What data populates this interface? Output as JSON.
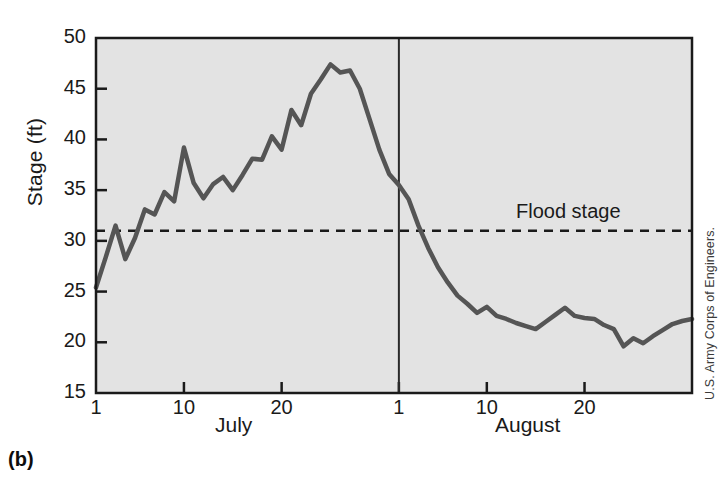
{
  "figure": {
    "panel_label": "(b)",
    "credit": "U.S. Army Corps of Engineers.",
    "flood_stage_label": "Flood stage",
    "plot_bg_color": "#e3e3e3",
    "line_color": "#555555",
    "frame_color": "#1a1a1a",
    "page_bg_color": "#ffffff"
  },
  "chart_data": {
    "type": "line",
    "title": "",
    "xlabel": "",
    "ylabel": "Stage (ft)",
    "ylim": [
      15,
      50
    ],
    "yticks": [
      15,
      20,
      25,
      30,
      35,
      40,
      45,
      50
    ],
    "ytick_labels": [
      "15",
      "20",
      "25",
      "30",
      "35",
      "40",
      "45",
      "50"
    ],
    "grid": false,
    "legend": "none",
    "x_axis_type": "date",
    "x_month_labels": [
      "July",
      "August"
    ],
    "xticks": [
      {
        "day_index": 0,
        "label": "1",
        "month": "July"
      },
      {
        "day_index": 9,
        "label": "10",
        "month": "July"
      },
      {
        "day_index": 19,
        "label": "20",
        "month": "July"
      },
      {
        "day_index": 31,
        "label": "1",
        "month": "August"
      },
      {
        "day_index": 40,
        "label": "10",
        "month": "August"
      },
      {
        "day_index": 50,
        "label": "20",
        "month": "August"
      }
    ],
    "annotations": [
      {
        "name": "flood-stage-line",
        "type": "hline",
        "y": 31.0,
        "style": "dashed",
        "label": "Flood stage"
      },
      {
        "name": "month-divider",
        "type": "vline",
        "x_day_index": 31,
        "style": "solid"
      }
    ],
    "series": [
      {
        "name": "River stage",
        "units": "ft",
        "x": [
          0,
          1,
          2,
          3,
          4,
          5,
          6,
          7,
          8,
          9,
          10,
          11,
          12,
          13,
          14,
          15,
          16,
          17,
          18,
          19,
          20,
          21,
          22,
          23,
          24,
          25,
          26,
          27,
          28,
          29,
          30,
          31,
          32,
          33,
          34,
          35,
          36,
          37,
          38,
          39,
          40,
          41,
          42,
          43,
          44,
          45,
          46,
          47,
          48,
          49,
          50,
          51,
          52,
          53,
          54,
          55,
          56,
          57,
          58,
          59,
          60,
          61
        ],
        "x_labels": [
          "Jul 1",
          "Jul 2",
          "Jul 3",
          "Jul 4",
          "Jul 5",
          "Jul 6",
          "Jul 7",
          "Jul 8",
          "Jul 9",
          "Jul 10",
          "Jul 11",
          "Jul 12",
          "Jul 13",
          "Jul 14",
          "Jul 15",
          "Jul 16",
          "Jul 17",
          "Jul 18",
          "Jul 19",
          "Jul 20",
          "Jul 21",
          "Jul 22",
          "Jul 23",
          "Jul 24",
          "Jul 25",
          "Jul 26",
          "Jul 27",
          "Jul 28",
          "Jul 29",
          "Jul 30",
          "Jul 31",
          "Aug 1",
          "Aug 2",
          "Aug 3",
          "Aug 4",
          "Aug 5",
          "Aug 6",
          "Aug 7",
          "Aug 8",
          "Aug 9",
          "Aug 10",
          "Aug 11",
          "Aug 12",
          "Aug 13",
          "Aug 14",
          "Aug 15",
          "Aug 16",
          "Aug 17",
          "Aug 18",
          "Aug 19",
          "Aug 20",
          "Aug 21",
          "Aug 22",
          "Aug 23",
          "Aug 24",
          "Aug 25",
          "Aug 26",
          "Aug 27",
          "Aug 28",
          "Aug 29",
          "Aug 30",
          "Aug 31"
        ],
        "values": [
          25.4,
          28.4,
          31.5,
          28.2,
          30.3,
          33.1,
          32.6,
          34.8,
          33.9,
          39.2,
          35.7,
          34.2,
          35.6,
          36.3,
          35.0,
          36.5,
          38.1,
          38.0,
          40.3,
          39.0,
          42.9,
          41.4,
          44.5,
          45.9,
          47.4,
          46.6,
          46.8,
          45.0,
          42.0,
          39.0,
          36.6,
          35.5,
          34.1,
          31.5,
          29.3,
          27.4,
          25.9,
          24.6,
          23.8,
          22.9,
          23.5,
          22.6,
          22.3,
          21.9,
          21.6,
          21.3,
          22.0,
          22.7,
          23.4,
          22.6,
          22.4,
          22.3,
          21.7,
          21.3,
          19.6,
          20.4,
          19.9,
          20.6,
          21.2,
          21.8,
          22.1,
          22.3
        ]
      }
    ]
  }
}
